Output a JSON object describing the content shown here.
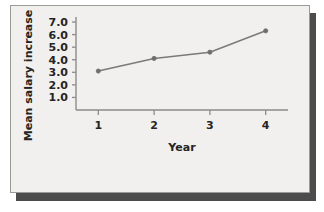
{
  "figure": {
    "background_color": "#ffffff",
    "card_color": "#f1f0ee",
    "card_border_color": "#9a9a97",
    "shadow_color": "#4c4c4c",
    "line_color": "#7a7a7a",
    "marker_color": "#6e6e6e",
    "axis_color": "#8b8b8b",
    "text_color": "#242424"
  },
  "chart_data": {
    "type": "line",
    "title": "",
    "xlabel": "Year",
    "ylabel": "Mean salary increase (%)",
    "x": [
      1,
      2,
      3,
      4
    ],
    "values": [
      3.1,
      4.1,
      4.6,
      6.3
    ],
    "categories": [
      "1",
      "2",
      "3",
      "4"
    ],
    "xtick_labels": [
      "1",
      "2",
      "3",
      "4"
    ],
    "ytick_labels": [
      "1.0",
      "2.0",
      "3.0",
      "4.0",
      "5.0",
      "6.0",
      "7.0"
    ],
    "ytick_values": [
      1.0,
      2.0,
      3.0,
      4.0,
      5.0,
      6.0,
      7.0
    ],
    "xlim": [
      0.6,
      4.4
    ],
    "ylim": [
      0.0,
      7.4
    ],
    "grid": false,
    "legend": false,
    "legend_position": "none",
    "marker": "circle",
    "series": [
      {
        "name": "Mean salary increase (%)",
        "values": [
          3.1,
          4.1,
          4.6,
          6.3
        ]
      }
    ]
  }
}
